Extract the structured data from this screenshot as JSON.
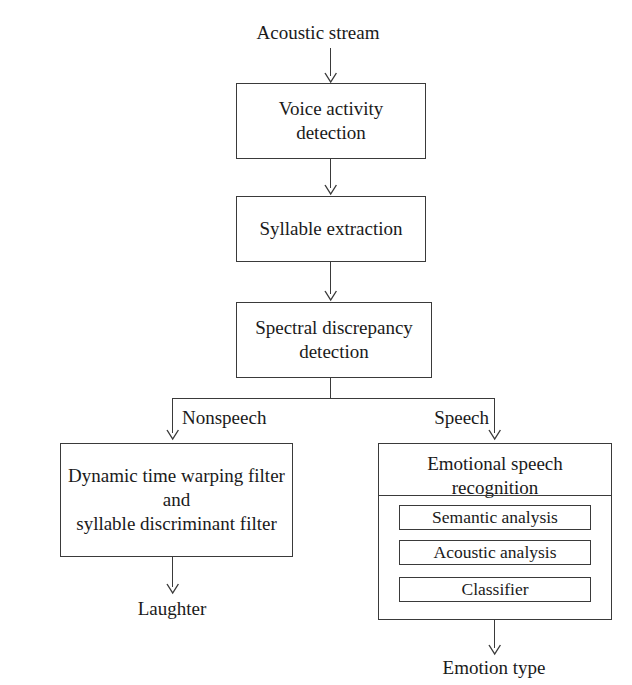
{
  "diagram": {
    "title": "Acoustic stream",
    "input_label": "Acoustic stream",
    "nodes": {
      "voice_activity_detection": {
        "line1": "Voice activity",
        "line2": "detection"
      },
      "syllable_extraction": {
        "line1": "Syllable extraction"
      },
      "spectral_discrepancy_detection": {
        "line1": "Spectral discrepancy",
        "line2": "detection"
      },
      "dtw_filter": {
        "line1": "Dynamic time warping filter",
        "line2": "and",
        "line3": "syllable discriminant filter"
      },
      "emotional_speech_recognition": {
        "line1": "Emotional speech",
        "line2": "recognition",
        "children": [
          {
            "label": "Semantic analysis"
          },
          {
            "label": "Acoustic analysis"
          },
          {
            "label": "Classifier"
          }
        ]
      }
    },
    "branch_labels": {
      "left": "Nonspeech",
      "right": "Speech"
    },
    "outputs": {
      "left": "Laughter",
      "right": "Emotion type"
    },
    "colors": {
      "stroke": "#3a3a3a",
      "text": "#1a1a1a",
      "background": "#ffffff"
    }
  }
}
